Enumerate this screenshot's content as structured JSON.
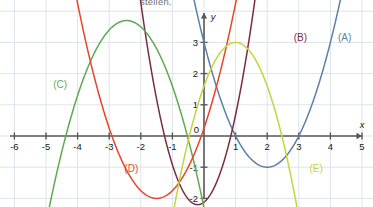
{
  "caption": {
    "text": "stellen."
  },
  "axes": {
    "x_axis_label": "x",
    "y_axis_label": "y",
    "origin_label": "0",
    "x_ticks": [
      {
        "value": -6,
        "label": "-6"
      },
      {
        "value": -5,
        "label": "-5"
      },
      {
        "value": -4,
        "label": "-4"
      },
      {
        "value": -3,
        "label": "-3"
      },
      {
        "value": -2,
        "label": "-2"
      },
      {
        "value": -1,
        "label": "-1"
      },
      {
        "value": 1,
        "label": "1"
      },
      {
        "value": 2,
        "label": "2"
      },
      {
        "value": 3,
        "label": "3"
      },
      {
        "value": 4,
        "label": "4"
      },
      {
        "value": 5,
        "label": "5"
      }
    ],
    "y_ticks": [
      {
        "value": 3,
        "label": "3"
      },
      {
        "value": 2,
        "label": "2"
      },
      {
        "value": 1,
        "label": "1"
      },
      {
        "value": -1,
        "label": "-1"
      },
      {
        "value": -2,
        "label": "-2"
      }
    ],
    "axis_color": "#58595b",
    "grid_color": "#dfe3ea"
  },
  "chart_data": {
    "type": "line",
    "title": "",
    "xlabel": "x",
    "ylabel": "y",
    "xlim": [
      -6.6,
      5.6
    ],
    "ylim": [
      -2.3,
      4.0
    ],
    "grid": true,
    "legend_position": "inline-labels",
    "series": [
      {
        "name": "(A)",
        "color": "#5b7fa6",
        "equation": "y = (x - 2)^2 - 1",
        "a": 1,
        "h": 2,
        "k": -1,
        "vertex": [
          2,
          -1
        ],
        "roots": [
          1,
          3
        ],
        "label_x": 4.45,
        "label_y": 3.05
      },
      {
        "name": "(B)",
        "color": "#7b2d42",
        "equation": "y = 2(x + 0.2)^2 - 2.2",
        "a": 2,
        "h": -0.2,
        "k": -2.2,
        "vertex": [
          -0.2,
          -2.2
        ],
        "roots": [
          -1.25,
          0.85
        ],
        "label_x": 3.05,
        "label_y": 3.05
      },
      {
        "name": "(C)",
        "color": "#5faa50",
        "equation": "y = -(x + 2.45)^2 + 3.7",
        "a": -1,
        "h": -2.45,
        "k": 3.7,
        "vertex": [
          -2.45,
          3.7
        ],
        "roots": [
          -4.37,
          -0.53
        ],
        "label_x": -4.55,
        "label_y": 1.55
      },
      {
        "name": "(D)",
        "color": "#e8442a",
        "equation": "y = (x + 1.5)^2 - 2",
        "a": 1,
        "h": -1.5,
        "k": -2,
        "vertex": [
          -1.5,
          -2
        ],
        "roots": [
          -2.91,
          -0.09
        ],
        "label_x": -2.3,
        "label_y": -1.15
      },
      {
        "name": "(E)",
        "color": "#c2d53f",
        "equation": "y = -1.4(x - 1)^2 + 3",
        "a": -1.4,
        "h": 1,
        "k": 3,
        "vertex": [
          1,
          3
        ],
        "roots": [
          -0.46,
          2.46
        ],
        "label_x": 3.55,
        "label_y": -1.15
      }
    ]
  }
}
